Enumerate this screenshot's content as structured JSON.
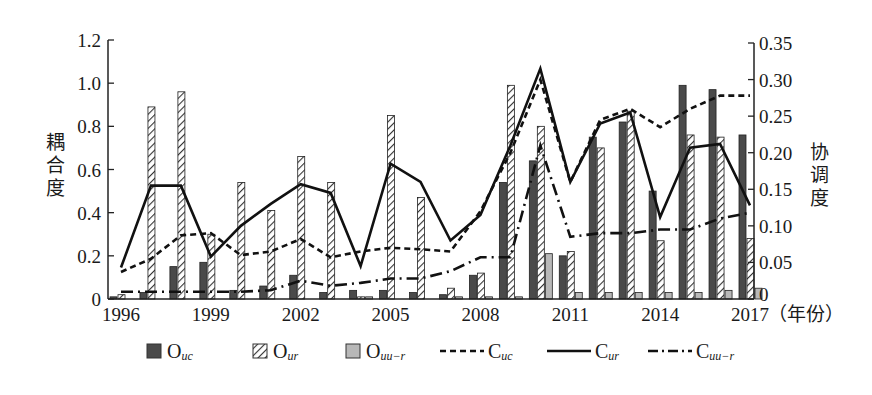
{
  "chart_data": {
    "type": "bar+line",
    "title": "",
    "categories": [
      "1996",
      "1997",
      "1998",
      "1999",
      "2000",
      "2001",
      "2002",
      "2003",
      "2004",
      "2005",
      "2006",
      "2007",
      "2008",
      "2009",
      "2010",
      "2011",
      "2012",
      "2013",
      "2014",
      "2015",
      "2016",
      "2017"
    ],
    "x_tick_labels": [
      "1996",
      "1999",
      "2002",
      "2005",
      "2008",
      "2011",
      "2014",
      "2017"
    ],
    "xlabel": "（年份）",
    "left_axis": {
      "label": "耦合度",
      "ylim": [
        0,
        1.2
      ],
      "ticks": [
        "0",
        "0.2",
        "0.4",
        "0.6",
        "0.8",
        "1.0",
        "1.2"
      ]
    },
    "right_axis": {
      "label": "协调度",
      "ylim": [
        0,
        0.35
      ],
      "ticks": [
        "0",
        "0.05",
        "0.10",
        "0.15",
        "0.20",
        "0.25",
        "0.30",
        "0.35"
      ]
    },
    "series": [
      {
        "name": "O_uc",
        "label_main": "O",
        "label_sub": "uc",
        "type": "bar",
        "axis": "left",
        "style": "dark-gray",
        "values": [
          0.01,
          0.03,
          0.15,
          0.17,
          0.04,
          0.06,
          0.11,
          0.03,
          0.04,
          0.04,
          0.03,
          0.02,
          0.11,
          0.54,
          0.64,
          0.2,
          0.75,
          0.82,
          0.5,
          0.99,
          0.97,
          0.76
        ]
      },
      {
        "name": "O_ur",
        "label_main": "O",
        "label_sub": "ur",
        "type": "bar",
        "axis": "left",
        "style": "hatched",
        "values": [
          0.02,
          0.89,
          0.96,
          0.3,
          0.54,
          0.41,
          0.66,
          0.54,
          0.01,
          0.85,
          0.47,
          0.05,
          0.12,
          0.99,
          0.8,
          0.22,
          0.7,
          0.87,
          0.27,
          0.76,
          0.75,
          0.28
        ]
      },
      {
        "name": "O_uu-r",
        "label_main": "O",
        "label_sub": "uu−r",
        "type": "bar",
        "axis": "left",
        "style": "light-gray",
        "values": [
          0.0,
          0.0,
          0.0,
          0.0,
          0.0,
          0.0,
          0.0,
          0.0,
          0.01,
          0.0,
          0.0,
          0.01,
          0.01,
          0.01,
          0.21,
          0.03,
          0.03,
          0.03,
          0.03,
          0.03,
          0.04,
          0.05
        ]
      },
      {
        "name": "C_uc",
        "label_main": "C",
        "label_sub": "uc",
        "type": "line",
        "axis": "right",
        "style": "dashed",
        "values": [
          0.037,
          0.055,
          0.087,
          0.09,
          0.06,
          0.065,
          0.082,
          0.057,
          0.065,
          0.07,
          0.068,
          0.065,
          0.12,
          0.2,
          0.3,
          0.16,
          0.245,
          0.26,
          0.235,
          0.26,
          0.278,
          0.278
        ]
      },
      {
        "name": "C_ur",
        "label_main": "C",
        "label_sub": "ur",
        "type": "line",
        "axis": "right",
        "style": "solid",
        "values": [
          0.043,
          0.155,
          0.155,
          0.058,
          0.1,
          0.13,
          0.157,
          0.145,
          0.045,
          0.185,
          0.16,
          0.08,
          0.115,
          0.21,
          0.315,
          0.16,
          0.24,
          0.255,
          0.112,
          0.207,
          0.212,
          0.128
        ]
      },
      {
        "name": "C_uu-r",
        "label_main": "C",
        "label_sub": "uu−r",
        "type": "line",
        "axis": "right",
        "style": "dash-dot",
        "values": [
          0.01,
          0.01,
          0.01,
          0.01,
          0.01,
          0.012,
          0.025,
          0.018,
          0.022,
          0.028,
          0.028,
          0.038,
          0.057,
          0.057,
          0.21,
          0.085,
          0.09,
          0.09,
          0.095,
          0.095,
          0.11,
          0.118
        ]
      }
    ],
    "legend_position": "bottom",
    "grid": false
  },
  "legend": [
    {
      "main": "O",
      "sub": "uc"
    },
    {
      "main": "O",
      "sub": "ur"
    },
    {
      "main": "O",
      "sub": "uu−r"
    },
    {
      "main": "C",
      "sub": "uc"
    },
    {
      "main": "C",
      "sub": "ur"
    },
    {
      "main": "C",
      "sub": "uu−r"
    }
  ],
  "labels": {
    "left_axis_title": "耦合度",
    "right_axis_title": "协调度",
    "x_unit": "（年份）"
  },
  "colors": {
    "dark_bar": "#4a4a4a",
    "light_bar": "#b8b8b8",
    "line": "#111111",
    "axis": "#222222"
  }
}
